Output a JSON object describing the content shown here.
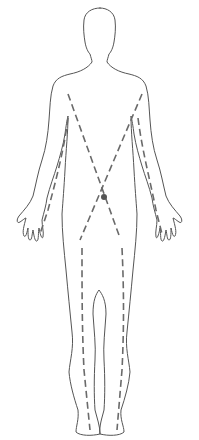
{
  "diagram": {
    "type": "anatomical-outline",
    "colors": {
      "background": "#ffffff",
      "outline": "#555555",
      "dashed_path": "#6a6a6a",
      "center_point": "#555555"
    },
    "elements": [
      {
        "name": "body-outline",
        "style": "solid thin line"
      },
      {
        "name": "left-shoulder-to-cross-path",
        "style": "dashed"
      },
      {
        "name": "right-shoulder-to-cross-path",
        "style": "dashed"
      },
      {
        "name": "left-arm-path",
        "style": "dashed"
      },
      {
        "name": "right-arm-path",
        "style": "dashed"
      },
      {
        "name": "left-leg-path",
        "style": "dashed"
      },
      {
        "name": "right-leg-path",
        "style": "dashed"
      },
      {
        "name": "center-point",
        "style": "filled dot"
      }
    ],
    "caption": ""
  }
}
